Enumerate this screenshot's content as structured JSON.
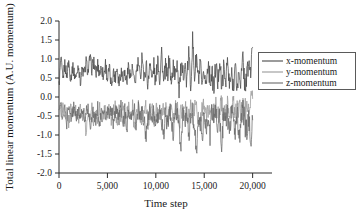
{
  "chart_data": {
    "type": "line",
    "title": "",
    "xlabel": "Time step",
    "ylabel": "Total linear momentum (A.U. momentum)",
    "xlim": [
      0,
      22000
    ],
    "ylim": [
      -2.0,
      2.0
    ],
    "grid": false,
    "legend_position": "right-outside",
    "xticks": [
      0,
      5000,
      10000,
      15000,
      20000
    ],
    "xticklabels": [
      "0",
      "5,000",
      "10,000",
      "15,000",
      "20,000"
    ],
    "yticks": [
      -2.0,
      -1.5,
      -1.0,
      -0.5,
      0.0,
      0.5,
      1.0,
      1.5,
      2.0
    ],
    "yticklabels": [
      "-2.0",
      "-1.5",
      "-1.0",
      "-0.5",
      "0.0",
      "0.5",
      "1.0",
      "1.5",
      "2.0"
    ],
    "colors": {
      "x_momentum": "#4a4a4a",
      "y_momentum": "#9a9a9a",
      "z_momentum": "#6a6a6a"
    },
    "x": [
      0,
      200,
      400,
      600,
      800,
      1000,
      1200,
      1400,
      1600,
      1800,
      2000,
      2200,
      2400,
      2600,
      2800,
      3000,
      3200,
      3400,
      3600,
      3800,
      4000,
      4200,
      4400,
      4600,
      4800,
      5000,
      5200,
      5400,
      5600,
      5800,
      6000,
      6200,
      6400,
      6600,
      6800,
      7000,
      7200,
      7400,
      7600,
      7800,
      8000,
      8200,
      8400,
      8600,
      8800,
      9000,
      9200,
      9400,
      9600,
      9800,
      10000,
      10200,
      10400,
      10600,
      10800,
      11000,
      11200,
      11400,
      11600,
      11800,
      12000,
      12200,
      12400,
      12600,
      12800,
      13000,
      13200,
      13400,
      13600,
      13800,
      14000,
      14200,
      14400,
      14600,
      14800,
      15000,
      15200,
      15400,
      15600,
      15800,
      16000,
      16200,
      16400,
      16600,
      16800,
      17000,
      17200,
      17400,
      17600,
      17800,
      18000,
      18200,
      18400,
      18600,
      18800,
      19000,
      19200,
      19400,
      19600,
      19800,
      20000
    ],
    "series": [
      {
        "name": "x-momentum",
        "values": [
          0.3,
          1.02,
          0.42,
          0.88,
          0.55,
          0.95,
          0.48,
          0.78,
          0.6,
          0.52,
          0.86,
          0.4,
          0.72,
          0.58,
          0.92,
          0.66,
          1.02,
          0.74,
          0.96,
          0.58,
          0.84,
          0.62,
          0.78,
          0.54,
          0.88,
          0.46,
          0.74,
          0.3,
          0.66,
          0.52,
          0.8,
          0.38,
          0.7,
          0.56,
          0.62,
          0.42,
          0.84,
          0.5,
          0.74,
          0.28,
          0.66,
          0.9,
          0.44,
          1.2,
          0.36,
          0.92,
          0.24,
          1.04,
          0.4,
          0.84,
          0.3,
          1.12,
          0.46,
          1.22,
          0.34,
          0.78,
          0.52,
          1.06,
          0.26,
          0.9,
          0.44,
          1.02,
          0.2,
          0.74,
          0.58,
          0.86,
          0.36,
          1.18,
          0.3,
          1.48,
          0.54,
          1.06,
          0.4,
          0.82,
          0.14,
          0.66,
          0.3,
          0.96,
          0.44,
          0.62,
          0.18,
          0.88,
          0.34,
          1.04,
          0.2,
          0.72,
          0.46,
          0.94,
          0.26,
          0.56,
          0.36,
          0.78,
          0.22,
          0.64,
          0.42,
          1.02,
          0.3,
          0.56,
          0.88,
          0.64,
          1.3
        ]
      },
      {
        "name": "y-momentum",
        "values": [
          -0.06,
          -0.52,
          -0.2,
          -0.62,
          -0.34,
          -0.7,
          -0.26,
          -0.58,
          -0.4,
          -0.3,
          -0.66,
          -0.22,
          -0.54,
          -0.36,
          -1.0,
          -0.44,
          -0.62,
          -0.28,
          -0.7,
          -0.38,
          -0.56,
          -0.24,
          -0.64,
          -0.42,
          -0.34,
          -0.58,
          -0.26,
          -0.72,
          -0.4,
          -0.3,
          -0.6,
          -0.36,
          -0.52,
          -0.28,
          -0.66,
          -0.44,
          -0.34,
          -0.58,
          -0.22,
          -0.86,
          -0.4,
          -0.3,
          -0.64,
          -0.48,
          -0.36,
          -0.26,
          -0.7,
          -0.42,
          -0.32,
          -0.6,
          -0.38,
          -0.28,
          -0.66,
          -0.46,
          -0.34,
          -0.24,
          -0.62,
          -0.4,
          -0.3,
          -0.56,
          -0.36,
          -0.26,
          -0.7,
          -0.44,
          -0.32,
          -0.2,
          -0.58,
          -0.38,
          -0.28,
          -0.5,
          -0.34,
          -0.22,
          -0.62,
          -0.42,
          -0.3,
          -0.18,
          -0.54,
          -0.36,
          -0.26,
          -0.6,
          -0.4,
          -0.28,
          -0.48,
          -0.34,
          -0.22,
          -0.56,
          -0.38,
          -0.26,
          -0.44,
          -0.3,
          -0.2,
          -0.52,
          -0.36,
          -0.24,
          -0.46,
          -0.32,
          -0.22,
          -0.4,
          -0.28,
          -0.18,
          -0.04
        ]
      },
      {
        "name": "z-momentum",
        "values": [
          -0.4,
          -0.18,
          -0.6,
          -0.3,
          -0.72,
          -0.22,
          -0.52,
          -0.36,
          -0.24,
          -0.64,
          -0.34,
          -0.56,
          -0.26,
          -0.7,
          -0.42,
          -0.3,
          -0.8,
          -0.48,
          -0.36,
          -0.66,
          -0.28,
          -0.74,
          -0.4,
          -0.3,
          -0.62,
          -0.36,
          -0.52,
          -0.24,
          -0.68,
          -0.44,
          -0.32,
          -0.58,
          -0.26,
          -0.7,
          -0.38,
          -0.84,
          -0.3,
          -0.62,
          -0.44,
          -0.34,
          -0.76,
          -0.28,
          -0.54,
          -0.38,
          -0.66,
          -1.02,
          -0.44,
          -0.3,
          -0.72,
          -0.36,
          -0.9,
          -0.52,
          -0.28,
          -0.64,
          -1.06,
          -0.38,
          -0.76,
          -0.3,
          -0.58,
          -0.96,
          -0.42,
          -0.34,
          -0.82,
          -1.24,
          -0.46,
          -0.68,
          -0.3,
          -1.0,
          -0.54,
          -0.36,
          -0.88,
          -1.52,
          -0.42,
          -0.64,
          -1.14,
          -0.34,
          -0.8,
          -0.48,
          -1.02,
          -0.3,
          -0.66,
          -0.38,
          -0.92,
          -0.52,
          -1.48,
          -0.34,
          -0.74,
          -0.44,
          -1.06,
          -0.28,
          -0.62,
          -0.86,
          -0.4,
          -1.18,
          -0.5,
          -0.32,
          -0.7,
          -0.96,
          -0.42,
          -1.32,
          -0.6
        ]
      }
    ]
  },
  "legend": {
    "items": [
      {
        "label": "x-momentum",
        "color_key": "x_momentum"
      },
      {
        "label": "y-momentum",
        "color_key": "y_momentum"
      },
      {
        "label": "z-momentum",
        "color_key": "z_momentum"
      }
    ]
  }
}
